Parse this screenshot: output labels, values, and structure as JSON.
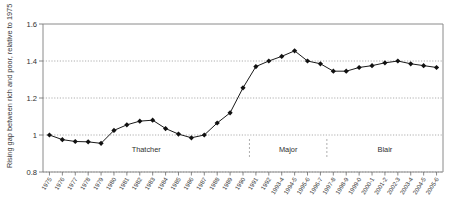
{
  "chart_data": {
    "type": "line",
    "title": "",
    "subtitle": "",
    "xlabel": "",
    "ylabel": "Rising gap between rich and poor, relative to 1975",
    "ylim": [
      0.8,
      1.6
    ],
    "yticks": [
      0.8,
      1,
      1.2,
      1.4,
      1.6
    ],
    "ytick_labels": [
      "0.8",
      "1",
      "1.2",
      "1.4",
      "1.6"
    ],
    "grid": true,
    "grid_axis": "y",
    "legend": "none",
    "marker": "filled-diamond",
    "line_color": "#111111",
    "marker_color": "#111111",
    "categories": [
      "1975",
      "1976",
      "1977",
      "1978",
      "1979",
      "1980",
      "1981",
      "1982",
      "1983",
      "1984",
      "1985",
      "1986",
      "1987",
      "1988",
      "1989",
      "1990",
      "1991",
      "1992",
      "1993-4",
      "1994-5",
      "1995-6",
      "1996-7",
      "1997-8",
      "1998-9",
      "1999-0",
      "2000-1",
      "2001-2",
      "2002-3",
      "2003-4",
      "2004-5",
      "2005-6"
    ],
    "values": [
      1.0,
      0.975,
      0.965,
      0.963,
      0.955,
      1.025,
      1.055,
      1.075,
      1.08,
      1.035,
      1.005,
      0.985,
      1.0,
      1.065,
      1.12,
      1.255,
      1.37,
      1.4,
      1.425,
      1.455,
      1.4,
      1.385,
      1.345,
      1.345,
      1.365,
      1.375,
      1.39,
      1.4,
      1.385,
      1.375,
      1.365
    ],
    "annotations": [
      {
        "label": "Thatcher",
        "position": "era-1"
      },
      {
        "label": "Major",
        "position": "era-2"
      },
      {
        "label": "Blair",
        "position": "era-3"
      }
    ],
    "era_labels": [
      "Thatcher",
      "Major",
      "Blair"
    ]
  },
  "axis": {
    "y_title": "Rising gap between rich and poor, relative to 1975"
  }
}
